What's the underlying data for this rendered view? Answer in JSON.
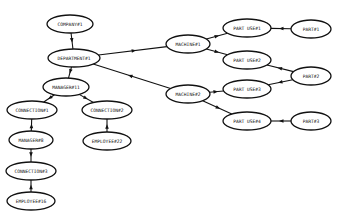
{
  "diagram": {
    "type": "entity-relationship graph",
    "nodes": [
      {
        "id": "company1",
        "label": "COMPANY#1",
        "x": 70,
        "y": 24,
        "rx": 23,
        "ry": 9
      },
      {
        "id": "department1",
        "label": "DEPARTMENT#1",
        "x": 74,
        "y": 58,
        "rx": 26,
        "ry": 9
      },
      {
        "id": "manager11",
        "label": "MANAGER#11",
        "x": 66,
        "y": 87,
        "rx": 23,
        "ry": 9
      },
      {
        "id": "connection1",
        "label": "CONNECTION#1",
        "x": 32,
        "y": 110,
        "rx": 25,
        "ry": 9
      },
      {
        "id": "connection2",
        "label": "CONNECTION#2",
        "x": 107,
        "y": 110,
        "rx": 25,
        "ry": 9
      },
      {
        "id": "manager8",
        "label": "MANAGER#8",
        "x": 31,
        "y": 140,
        "rx": 22,
        "ry": 9
      },
      {
        "id": "employee22",
        "label": "EMPLOYEE#22",
        "x": 107,
        "y": 141,
        "rx": 24,
        "ry": 9
      },
      {
        "id": "connection3",
        "label": "CONNECTION#3",
        "x": 31,
        "y": 171,
        "rx": 25,
        "ry": 9
      },
      {
        "id": "employee16",
        "label": "EMPLOYEE#16",
        "x": 31,
        "y": 201,
        "rx": 24,
        "ry": 9
      },
      {
        "id": "machine1",
        "label": "MACHINE#1",
        "x": 188,
        "y": 44,
        "rx": 22,
        "ry": 9
      },
      {
        "id": "machine2",
        "label": "MACHINE#2",
        "x": 188,
        "y": 94,
        "rx": 22,
        "ry": 9
      },
      {
        "id": "partuse1",
        "label": "PART USE#1",
        "x": 247,
        "y": 28,
        "rx": 24,
        "ry": 9
      },
      {
        "id": "partuse2",
        "label": "PART USE#2",
        "x": 247,
        "y": 60,
        "rx": 24,
        "ry": 9
      },
      {
        "id": "partuse3",
        "label": "PART USE#3",
        "x": 247,
        "y": 89,
        "rx": 24,
        "ry": 9
      },
      {
        "id": "partuse4",
        "label": "PART USE#4",
        "x": 247,
        "y": 121,
        "rx": 24,
        "ry": 9
      },
      {
        "id": "part1",
        "label": "PART#1",
        "x": 311,
        "y": 29,
        "rx": 20,
        "ry": 9
      },
      {
        "id": "part2",
        "label": "PART#2",
        "x": 311,
        "y": 76,
        "rx": 20,
        "ry": 9
      },
      {
        "id": "part3",
        "label": "PART#3",
        "x": 311,
        "y": 121,
        "rx": 20,
        "ry": 9
      }
    ],
    "edges": [
      {
        "from": "company1",
        "to": "department1"
      },
      {
        "from": "department1",
        "to": "manager11"
      },
      {
        "from": "department1",
        "to": "machine1"
      },
      {
        "from": "machine2",
        "to": "department1"
      },
      {
        "from": "manager11",
        "to": "connection1"
      },
      {
        "from": "manager11",
        "to": "connection2"
      },
      {
        "from": "manager8",
        "to": "connection1"
      },
      {
        "from": "manager8",
        "to": "connection3"
      },
      {
        "from": "employee16",
        "to": "connection3"
      },
      {
        "from": "employee22",
        "to": "connection2"
      },
      {
        "from": "machine1",
        "to": "partuse1"
      },
      {
        "from": "machine1",
        "to": "partuse2"
      },
      {
        "from": "machine2",
        "to": "partuse3"
      },
      {
        "from": "machine2",
        "to": "partuse4"
      },
      {
        "from": "part1",
        "to": "partuse1"
      },
      {
        "from": "part2",
        "to": "partuse2"
      },
      {
        "from": "part2",
        "to": "partuse3"
      },
      {
        "from": "part3",
        "to": "partuse4"
      }
    ]
  },
  "colors": {
    "stroke": "#111111",
    "fill": "#ffffff",
    "background": "#ffffff"
  }
}
